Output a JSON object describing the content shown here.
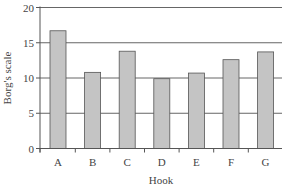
{
  "chart_data": {
    "type": "bar",
    "title": "",
    "xlabel": "Hook",
    "ylabel": "Borg's scale",
    "categories": [
      "A",
      "B",
      "C",
      "D",
      "E",
      "F",
      "G"
    ],
    "values": [
      16.7,
      10.8,
      13.8,
      9.9,
      10.7,
      12.6,
      13.7
    ],
    "ylim": [
      0,
      20
    ],
    "yticks": [
      0,
      5,
      10,
      15,
      20
    ],
    "grid": true,
    "legend": null,
    "colors": {
      "bar_fill": "#c4c4c4",
      "bar_stroke": "#555555",
      "grid": "#666666",
      "axis": "#555555"
    }
  }
}
